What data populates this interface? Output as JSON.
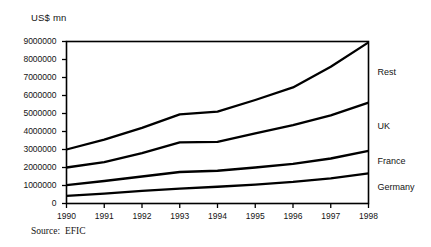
{
  "axis_unit_label": "US$ mn",
  "source": {
    "label": "Source:",
    "value": "EFIC"
  },
  "series_labels": {
    "rest": "Rest",
    "uk": "UK",
    "france": "France",
    "germany": "Germany"
  },
  "chart_data": {
    "type": "line",
    "title": "",
    "subtitle": "",
    "xlabel": "",
    "ylabel": "US$ mn",
    "grid": false,
    "legend_position": "right-inline",
    "categories": [
      "1990",
      "1991",
      "1992",
      "1993",
      "1994",
      "1995",
      "1996",
      "1997",
      "1998"
    ],
    "x": [
      1990,
      1991,
      1992,
      1993,
      1994,
      1995,
      1996,
      1997,
      1998
    ],
    "xlim": [
      1990,
      1998
    ],
    "ylim": [
      0,
      9000000
    ],
    "ytick_labels": [
      "0",
      "1000000",
      "2000000",
      "3000000",
      "4000000",
      "5000000",
      "6000000",
      "7000000",
      "8000000",
      "9000000"
    ],
    "yticks": [
      0,
      1000000,
      2000000,
      3000000,
      4000000,
      5000000,
      6000000,
      7000000,
      8000000,
      9000000
    ],
    "xtick_labels": [
      "1990",
      "1991",
      "1992",
      "1993",
      "1994",
      "1995",
      "1996",
      "1997",
      "1998"
    ],
    "series": [
      {
        "name": "Rest",
        "values": [
          3000000,
          3550000,
          4200000,
          4950000,
          5100000,
          5750000,
          6450000,
          7600000,
          8950000
        ]
      },
      {
        "name": "UK",
        "values": [
          2000000,
          2300000,
          2800000,
          3400000,
          3420000,
          3900000,
          4350000,
          4900000,
          5600000
        ]
      },
      {
        "name": "France",
        "values": [
          1020000,
          1250000,
          1500000,
          1750000,
          1820000,
          2000000,
          2200000,
          2500000,
          2930000
        ]
      },
      {
        "name": "Germany",
        "values": [
          420000,
          550000,
          700000,
          830000,
          930000,
          1050000,
          1200000,
          1400000,
          1670000
        ]
      }
    ]
  }
}
